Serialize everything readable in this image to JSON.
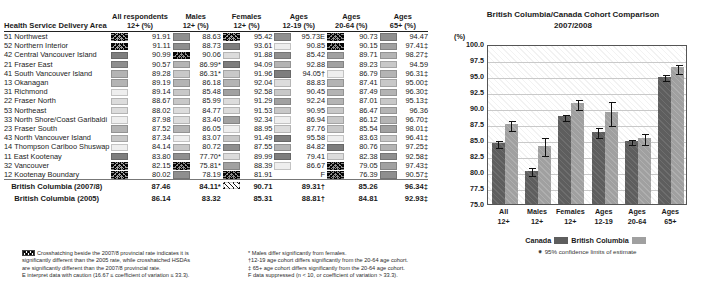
{
  "table": {
    "row_header": "Health Service Delivery Area",
    "columns": [
      {
        "top": "All respondents",
        "bottom": "12+ (%)"
      },
      {
        "top": "Males",
        "bottom": "12+ (%)"
      },
      {
        "top": "Females",
        "bottom": "12+ (%)"
      },
      {
        "top": "Ages",
        "bottom": "12-19 (%)"
      },
      {
        "top": "Ages",
        "bottom": "20-64 (%)"
      },
      {
        "top": "Ages",
        "bottom": "65+ (%)"
      }
    ],
    "rows": [
      {
        "area": "51 Northwest",
        "values": [
          "91.91",
          "88.63",
          "95.42",
          "95.73E",
          "90.73",
          "94.47"
        ],
        "shades": [
          "h4",
          "g3",
          "h4",
          "g3",
          "h3",
          "g3"
        ]
      },
      {
        "area": "52 Northern Interior",
        "values": [
          "91.11",
          "88.73",
          "93.61",
          "90.85",
          "90.15",
          "97.41‡"
        ],
        "shades": [
          "h4",
          "g3",
          "g2",
          "g8",
          "h3",
          "g4"
        ]
      },
      {
        "area": "42 Central Vancouver Island",
        "values": [
          "90.99",
          "90.06",
          "91.88",
          "85.42",
          "89.71",
          "98.27‡"
        ],
        "shades": [
          "g2",
          "h3",
          "g7",
          "g3",
          "g4",
          "g5"
        ]
      },
      {
        "area": "21 Fraser East",
        "values": [
          "90.57",
          "86.99*",
          "94.09",
          "92.88",
          "89.23",
          "94.59"
        ],
        "shades": [
          "g3",
          "g5",
          "g2",
          "g5",
          "g4",
          "g6"
        ]
      },
      {
        "area": "41 South Vancouver Island",
        "values": [
          "89.28",
          "86.31*",
          "91.96",
          "94.05†",
          "86.79",
          "96.31‡"
        ],
        "shades": [
          "g5",
          "g6",
          "g6",
          "g2",
          "g8",
          "g5"
        ]
      },
      {
        "area": "13 Okanagan",
        "values": [
          "89.19",
          "86.18",
          "92.04",
          "88.83",
          "87.41",
          "95.00‡"
        ],
        "shades": [
          "g5",
          "g5",
          "g5",
          "g7",
          "g5",
          "g6"
        ]
      },
      {
        "area": "31 Richmond",
        "values": [
          "89.14",
          "85.48",
          "92.58",
          "90.45",
          "87.49",
          "96.30‡"
        ],
        "shades": [
          "g8",
          "g6",
          "g4",
          "g6",
          "g5",
          "g5"
        ]
      },
      {
        "area": "22 Fraser North",
        "values": [
          "88.67",
          "85.99",
          "91.29",
          "92.24",
          "87.01",
          "95.13‡"
        ],
        "shades": [
          "g7",
          "g6",
          "g7",
          "g4",
          "g5",
          "g6"
        ]
      },
      {
        "area": "53 Northeast",
        "values": [
          "88.02",
          "84.77",
          "91.53",
          "90.95",
          "86.47",
          "96.36"
        ],
        "shades": [
          "g7",
          "g7",
          "g7",
          "g6",
          "g6",
          "g5"
        ]
      },
      {
        "area": "33 North Shore/Coast Garibaldi",
        "values": [
          "87.98",
          "83.40",
          "92.34",
          "86.94",
          "86.12",
          "96.70‡"
        ],
        "shades": [
          "g8",
          "g7",
          "g4",
          "g8",
          "g6",
          "g5"
        ]
      },
      {
        "area": "23 Fraser South",
        "values": [
          "87.52",
          "86.05",
          "88.95",
          "87.76",
          "85.54",
          "98.01‡"
        ],
        "shades": [
          "g5",
          "g5",
          "g8",
          "g7",
          "g6",
          "g4"
        ]
      },
      {
        "area": "43 North Vancouver Island",
        "values": [
          "87.34",
          "83.07",
          "91.49",
          "95.58",
          "83.63",
          "96.41‡"
        ],
        "shades": [
          "g6",
          "g8",
          "g6",
          "g2",
          "g8",
          "g6"
        ]
      },
      {
        "area": "14 Thompson Cariboo Shuswap",
        "values": [
          "84.14",
          "80.72",
          "87.55",
          "84.82",
          "80.76",
          "97.25‡"
        ],
        "shades": [
          "g8",
          "g6",
          "g3",
          "g5",
          "g2",
          "g5"
        ]
      },
      {
        "area": "11 East Kootenay",
        "values": [
          "83.80",
          "77.70*",
          "89.99",
          "79.41",
          "82.38",
          "92.58‡"
        ],
        "shades": [
          "g2",
          "g3",
          "g7",
          "g2",
          "g7",
          "g3"
        ]
      },
      {
        "area": "32 Vancouver",
        "values": [
          "82.15",
          "75.81*",
          "88.39",
          "86.67",
          "79.05",
          "97.43‡"
        ],
        "shades": [
          "h4",
          "h3",
          "g4",
          "g8",
          "h3",
          "g4"
        ]
      },
      {
        "area": "12 Kootenay Boundary",
        "values": [
          "80.02",
          "78.19",
          "81.91",
          "F",
          "76.39",
          "90.57‡"
        ],
        "shades": [
          "h4",
          "g3",
          "h3",
          "none",
          "h3",
          "g3"
        ]
      }
    ],
    "summary": [
      {
        "area": "British Columbia (2007/8)",
        "values": [
          "87.46",
          "84.11*",
          "90.71",
          "89.31†",
          "85.26",
          "96.34‡"
        ],
        "shades": [
          "none",
          "none",
          "hw",
          "none",
          "none",
          "none"
        ]
      },
      {
        "area": "British Columbia (2005)",
        "values": [
          "86.14",
          "83.32",
          "85.31",
          "88.81†",
          "84.81",
          "92.93‡"
        ],
        "shades": [
          "none",
          "none",
          "none",
          "none",
          "none",
          "none"
        ]
      }
    ]
  },
  "footnotes": {
    "left": [
      "Crosshatching beside the 2007/8 provincial rate indicates it is",
      "significantly different than the 2005 rate, while crosshatched HSDAs",
      "are significantly different than the 2007/8 provincial rate.",
      "E interpret data with caution (16.67 ≤ coefficient of variation ≤ 33.3)."
    ],
    "right": [
      "* Males differ significantly from females.",
      "†12-19 age cohort differs significantly from the 20-64 age cohort.",
      "‡ 65+ age cohort differs significantly from the 20-64 age cohort.",
      "F data suppressed (n < 10, or coefficient of variation > 33.3)."
    ]
  },
  "chart_data": {
    "type": "bar",
    "title": "British Columbia/Canada Cohort Comparison",
    "subtitle": "2007/2008",
    "ylabel": "(%)",
    "xlabel": "",
    "ylim": [
      75.0,
      100.0
    ],
    "yticks": [
      "100.0",
      "97.5",
      "95.0",
      "92.5",
      "90.0",
      "87.5",
      "85.0",
      "82.5",
      "80.0",
      "77.5",
      "75.0"
    ],
    "grid": true,
    "legend_position": "bottom",
    "legend": [
      "Canada",
      "British Columbia"
    ],
    "error_note": "95% confidence limits of estimate",
    "categories": [
      {
        "line1": "All",
        "line2": "12+"
      },
      {
        "line1": "Males",
        "line2": "12+"
      },
      {
        "line1": "Females",
        "line2": "12+"
      },
      {
        "line1": "Ages",
        "line2": "12-19"
      },
      {
        "line1": "Ages",
        "line2": "20-64"
      },
      {
        "line1": "Ages",
        "line2": "65+"
      }
    ],
    "series": [
      {
        "name": "Canada",
        "color": "#5e5e5e",
        "values": [
          84.5,
          80.2,
          88.7,
          86.3,
          84.9,
          94.9
        ],
        "err_low": [
          83.9,
          79.6,
          88.2,
          85.4,
          84.4,
          94.4
        ],
        "err_high": [
          85.1,
          80.9,
          89.2,
          87.2,
          85.3,
          95.4
        ]
      },
      {
        "name": "British Columbia",
        "color": "#a0a0a0",
        "values": [
          87.46,
          84.11,
          90.71,
          89.31,
          85.26,
          96.34
        ],
        "err_low": [
          86.6,
          82.6,
          89.8,
          87.4,
          84.3,
          95.5
        ],
        "err_high": [
          88.3,
          85.6,
          91.6,
          91.2,
          86.2,
          97.1
        ]
      }
    ]
  }
}
